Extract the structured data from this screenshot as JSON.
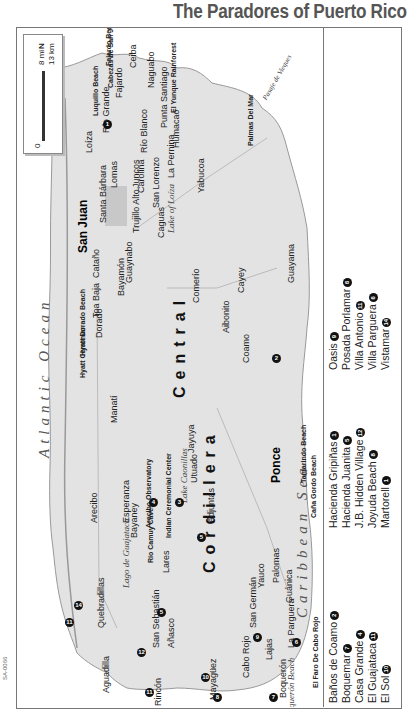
{
  "title": "The Paradores of Puerto Rico",
  "figure_code": "SA-0066",
  "map": {
    "orientation": "rotated 90°, north points left",
    "scale": {
      "mi": "8 mi",
      "km": "13 km",
      "zero": "0"
    },
    "compass": "N",
    "water": {
      "atlantic": "Atlantic Ocean",
      "caribbean": "Caribbean Sea",
      "passage": "Pasaje de Vieques",
      "anasco_bay": "Añasco Bay",
      "phosphorescent_bay": "Phosphorescent Bay"
    },
    "mountains": {
      "line1": "Cordillera",
      "line2": "Central"
    },
    "cities_major": [
      "San Juan",
      "Ponce"
    ],
    "towns": [
      "Loíza",
      "Río Grande",
      "Fajardo",
      "Ceiba",
      "Dagua o",
      "Naguabo",
      "Punta Santiago",
      "Humacao",
      "Yabucoa",
      "Las Piedras",
      "Juncos",
      "Lomas",
      "Río Blanco",
      "San Lorenzo",
      "La Pernina",
      "Caguas",
      "Trujillo Alto",
      "Carolina",
      "Santa Bárbara",
      "Cataño",
      "Toa Baja",
      "Bayamón",
      "Guaynabo",
      "Dorado",
      "Manatí",
      "Arecibo",
      "Esperanza",
      "Bayaney",
      "Utuado",
      "Jayuya",
      "Adjuntas",
      "Lares",
      "San Sebastián",
      "Quebradillas",
      "Aguadilla",
      "Rincón",
      "Añasco",
      "Mayagüez",
      "Cabo Rojo",
      "San Germán",
      "Lajas",
      "Boquerón",
      "La Parguera",
      "Guánica",
      "Yauco",
      "Palomas",
      "Coamo",
      "Aibonito",
      "Cayey",
      "Comerío",
      "Guayama",
      "Dagua"
    ],
    "sights": [
      "Cabezas de San Juan Nature Preserve",
      "Luquillo Beach",
      "Fajardo Beach",
      "El Yunque Rainforest",
      "Palmas Del Mar",
      "Hyatt Dorado Beach",
      "Hyatt Cerromar",
      "Arecibo Observatory",
      "Río Camuy Caves",
      "Indian Ceremonial Center",
      "Lago de Guajataca",
      "Lake Caonillas",
      "Lake of Loíza",
      "Tamarindo Beach",
      "Caña Gordo Beach",
      "Boquerón Beach",
      "El Faro De Cabo Rojo"
    ],
    "paradores_on_map": [
      {
        "n": "1",
        "label": "Hacienda Gripiñas"
      },
      {
        "n": "2",
        "label": "Parador Baños de Coamo"
      },
      {
        "n": "11",
        "label": "Parador Guajataca"
      },
      {
        "n": "14",
        "label": "Parador Vistamar"
      },
      {
        "n": "7",
        "label": "Parador El Boquemar"
      },
      {
        "n": "6",
        "label": "Parador Villa Parguera"
      }
    ],
    "routes": [
      "1",
      "2",
      "3",
      "10",
      "22",
      "52",
      "111",
      "115",
      "116",
      "119",
      "129",
      "134",
      "140",
      "151",
      "162",
      "181",
      "182",
      "183",
      "184",
      "191",
      "192",
      "30",
      "31",
      "32",
      "35",
      "36",
      "165",
      "635",
      "102",
      "100",
      "101",
      "307",
      "109"
    ]
  },
  "legend": {
    "col1": [
      {
        "name": "Baños de Coamo",
        "n": "2"
      },
      {
        "name": "Boquemar",
        "n": "7"
      },
      {
        "name": "Casa Grande",
        "n": "4"
      },
      {
        "name": "El Guajataca",
        "n": "11"
      },
      {
        "name": "El Sol",
        "n": "10"
      }
    ],
    "col2": [
      {
        "name": "Hacienda Gripiñas",
        "n": "1"
      },
      {
        "name": "Hacienda Juanita",
        "n": "5"
      },
      {
        "name": "J.B. Hidden Village",
        "n": "12"
      },
      {
        "name": "Joyuda Beach",
        "n": "8"
      },
      {
        "name": "Martorell",
        "n": "1"
      }
    ],
    "col3": [
      {
        "name": "Oasis",
        "n": "9"
      },
      {
        "name": "Posada Porlamar",
        "n": "6"
      },
      {
        "name": "Villa Antonio",
        "n": "11"
      },
      {
        "name": "Villa Parguera",
        "n": "6"
      },
      {
        "name": "Vistamar",
        "n": "14"
      }
    ]
  }
}
